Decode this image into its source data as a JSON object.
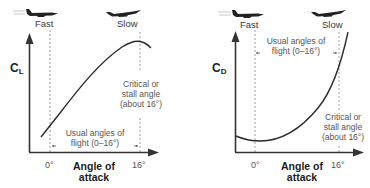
{
  "diagrams": [
    {
      "id": "lift",
      "y_label_main": "C",
      "y_label_sub": "L",
      "speed_left": "Fast",
      "speed_right": "Slow",
      "annotation_usual_line1": "Usual angles of",
      "annotation_usual_line2": "flight (0–16°)",
      "annotation_critical_line1": "Critical or",
      "annotation_critical_line2": "stall angle",
      "annotation_critical_line3": "(about 16°)",
      "tick_0": "0°",
      "tick_16": "16°",
      "x_label_line1": "Angle of",
      "x_label_line2": "attack"
    },
    {
      "id": "drag",
      "y_label_main": "C",
      "y_label_sub": "D",
      "speed_left": "Fast",
      "speed_right": "Slow",
      "annotation_usual_line1": "Usual angles of",
      "annotation_usual_line2": "flight (0–16°)",
      "annotation_critical_line1": "Critical or",
      "annotation_critical_line2": "stall angle",
      "annotation_critical_line3": "(about 16°)",
      "tick_0": "0°",
      "tick_16": "16°",
      "x_label_line1": "Angle of",
      "x_label_line2": "attack"
    }
  ],
  "colors": {
    "axis": "#333333",
    "curve": "#2a2a2a",
    "dashed": "#888888",
    "text": "#444444"
  }
}
